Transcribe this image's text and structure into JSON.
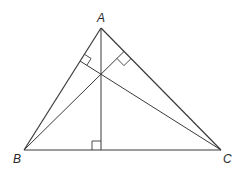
{
  "diagram": {
    "type": "triangle-altitudes",
    "vertices": {
      "A": {
        "label": "A",
        "x": 101,
        "y": 28
      },
      "B": {
        "label": "B",
        "x": 24,
        "y": 150
      },
      "C": {
        "label": "C",
        "x": 221,
        "y": 150
      }
    },
    "altitude_feet": {
      "from_A_on_BC": {
        "x": 101,
        "y": 150
      },
      "from_B_on_AC": {
        "x": 124,
        "y": 51.5
      },
      "from_C_on_AB": {
        "x": 80,
        "y": 61
      }
    },
    "right_angle_marks": 3,
    "colors": {
      "line": "#3a3a3a",
      "background": "#ffffff"
    }
  },
  "labels": {
    "A": "A",
    "B": "B",
    "C": "C"
  }
}
